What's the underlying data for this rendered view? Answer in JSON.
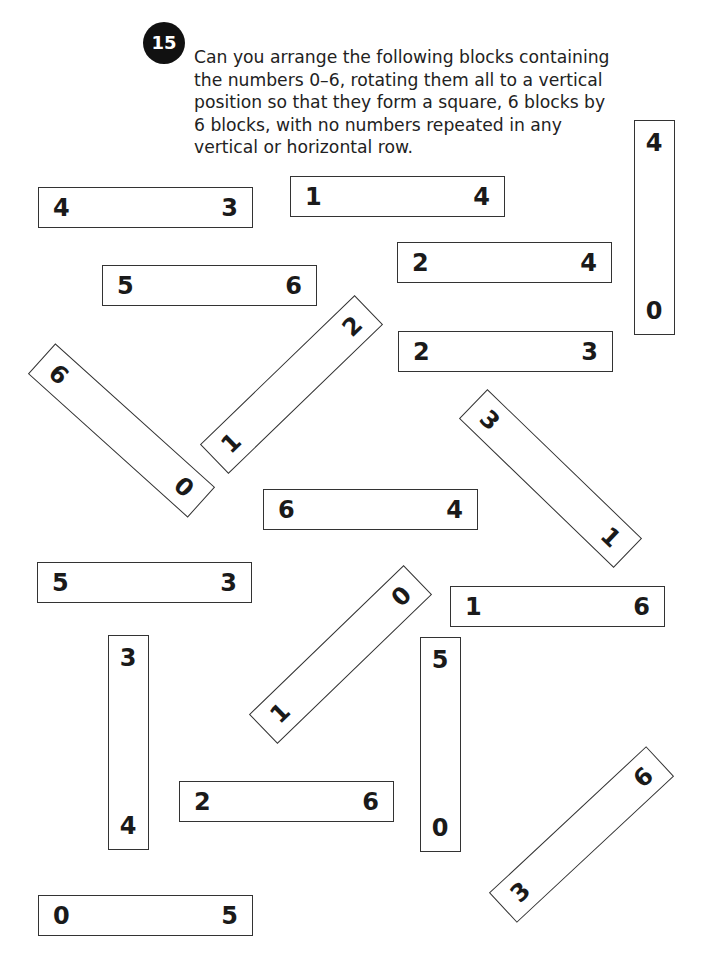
{
  "puzzle": {
    "number": "15",
    "prompt": "Can you arrange the following blocks containing the numbers 0–6, rotating them all to a vertical position so that they form a square, 6 blocks by 6 blocks, with no numbers repeated in any vertical or horizontal row."
  },
  "blocks": [
    {
      "a": "4",
      "b": "3",
      "orientation": "horizontal"
    },
    {
      "a": "1",
      "b": "4",
      "orientation": "horizontal"
    },
    {
      "a": "4",
      "b": "0",
      "orientation": "vertical"
    },
    {
      "a": "2",
      "b": "4",
      "orientation": "horizontal"
    },
    {
      "a": "5",
      "b": "6",
      "orientation": "horizontal"
    },
    {
      "a": "2",
      "b": "3",
      "orientation": "horizontal"
    },
    {
      "a": "6",
      "b": "0",
      "orientation": "diagonal-down"
    },
    {
      "a": "1",
      "b": "2",
      "orientation": "diagonal-up"
    },
    {
      "a": "3",
      "b": "1",
      "orientation": "diagonal-down"
    },
    {
      "a": "6",
      "b": "4",
      "orientation": "horizontal"
    },
    {
      "a": "5",
      "b": "3",
      "orientation": "horizontal"
    },
    {
      "a": "1",
      "b": "6",
      "orientation": "horizontal"
    },
    {
      "a": "1",
      "b": "0",
      "orientation": "diagonal-up"
    },
    {
      "a": "3",
      "b": "4",
      "orientation": "vertical"
    },
    {
      "a": "5",
      "b": "0",
      "orientation": "vertical"
    },
    {
      "a": "2",
      "b": "6",
      "orientation": "horizontal"
    },
    {
      "a": "3",
      "b": "6",
      "orientation": "diagonal-up"
    },
    {
      "a": "0",
      "b": "5",
      "orientation": "horizontal"
    }
  ]
}
